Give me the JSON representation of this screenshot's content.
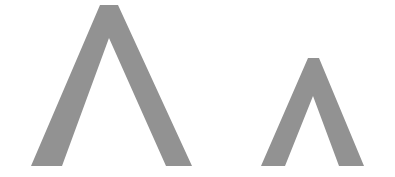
{
  "image": {
    "width": 395,
    "height": 177,
    "background": "#ffffff"
  },
  "shapes": [
    {
      "name": "large-caret",
      "color": "#929292",
      "points": "100,5 118,5 192,166 166,166 109,38 62,166 31,166"
    },
    {
      "name": "small-caret",
      "color": "#929292",
      "points": "308,58 319,58 364,166 339,166 313,96 285,166 261,166"
    }
  ]
}
